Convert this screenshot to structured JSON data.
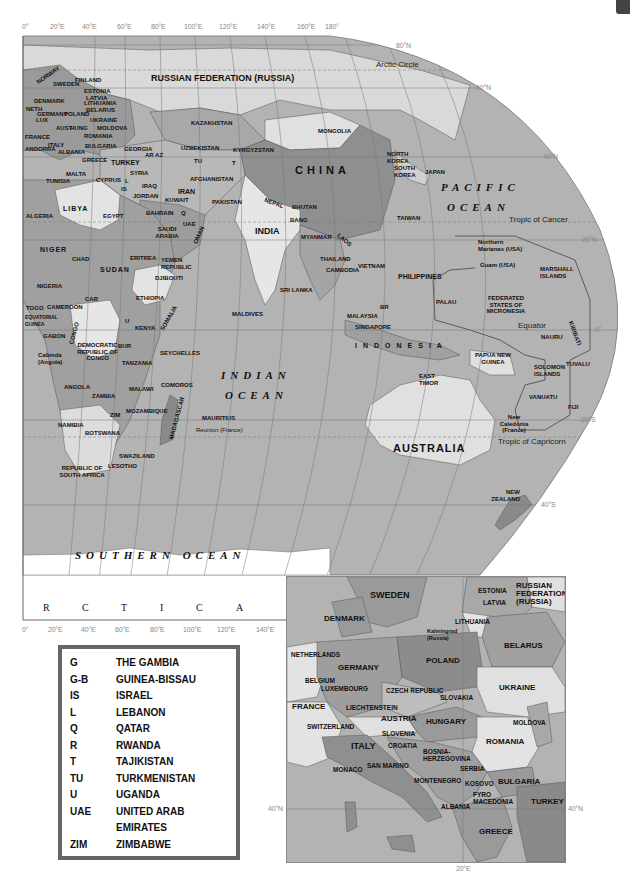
{
  "main_map": {
    "top_longitude_ticks": [
      "0°",
      "20°E",
      "40°E",
      "60°E",
      "80°E",
      "100°E",
      "120°E",
      "140°E",
      "160°E",
      "180°"
    ],
    "bottom_longitude_ticks": [
      "0°",
      "20°E",
      "40°E",
      "60°E",
      "80°E",
      "100°E",
      "120°E",
      "140°E"
    ],
    "latitude_ticks": [
      "80°N",
      "60°N",
      "40°N",
      "20°N",
      "0°",
      "20°S",
      "40°S"
    ],
    "reference_lines": {
      "arctic_circle": "Arctic Circle",
      "tropic_of_cancer": "Tropic of Cancer",
      "equator": "Equator",
      "tropic_of_capricorn": "Tropic of Capricorn"
    },
    "oceans": {
      "pacific_1": "PACIFIC",
      "pacific_2": "OCEAN",
      "indian_1": "INDIAN",
      "indian_2": "OCEAN",
      "southern": "SOUTHERN OCEAN"
    },
    "antarctica_letters": [
      "R",
      "C",
      "T",
      "I",
      "C",
      "A"
    ],
    "countries": {
      "russia": "RUSSIAN FEDERATION (RUSSIA)",
      "kazakhstan": "KAZAKHSTAN",
      "mongolia": "MONGOLIA",
      "china": "CHINA",
      "north_korea": "NORTH KOREA",
      "south_korea": "SOUTH KOREA",
      "japan": "JAPAN",
      "taiwan": "TAIWAN",
      "uzbekistan": "UZBEKISTAN",
      "kyrgyzstan": "KYRGYZSTAN",
      "tu": "TU",
      "t": "T",
      "afghanistan": "AFGHANISTAN",
      "pakistan": "PAKISTAN",
      "iran": "IRAN",
      "iraq": "IRAQ",
      "syria": "SYRIA",
      "turkey": "TURKEY",
      "georgia": "GEORGIA",
      "ar_az": "AR AZ",
      "cyprus": "CYPRUS",
      "l": "L",
      "is": "IS",
      "jordan": "JORDAN",
      "kuwait": "KUWAIT",
      "bahrain": "BAHRAIN",
      "q": "Q",
      "uae": "UAE",
      "saudi_arabia": "SAUDI ARABIA",
      "oman": "OMAN",
      "yemen": "YEMEN REPUBLIC",
      "india": "INDIA",
      "nepal": "NEPAL",
      "bhutan": "BHUTAN",
      "bang": "BANG",
      "myanmar": "MYANMAR",
      "laos": "LAOS",
      "thailand": "THAILAND",
      "cambodia": "CAMBODIA",
      "vietnam": "VIETNAM",
      "philippines": "PHILIPPINES",
      "sri_lanka": "SRI LANKA",
      "maldives": "MALDIVES",
      "malaysia": "MALAYSIA",
      "br": "BR",
      "singapore": "SINGAPORE",
      "indonesia": "INDONESIA",
      "east_timor": "EAST TIMOR",
      "papua_new_guinea": "PAPUA NEW GUINEA",
      "australia": "AUSTRALIA",
      "new_zealand": "NEW ZEALAND",
      "northern_marianas": "Northern Marianas (USA)",
      "guam": "Guam (USA)",
      "marshall_islands": "MARSHALL ISLANDS",
      "palau": "PALAU",
      "micronesia": "FEDERATED STATES OF MICRONESIA",
      "nauru": "NAURU",
      "kiribati": "KIRIBATI",
      "tuvalu": "TUVALU",
      "solomon_islands": "SOLOMON ISLANDS",
      "vanuatu": "VANUATU",
      "fiji": "FIJI",
      "new_caledonia": "New Caledonia (France)",
      "norway": "NORWAY",
      "sweden": "SWEDEN",
      "finland": "FINLAND",
      "estonia": "ESTONIA",
      "latvia": "LATVIA",
      "lithuania": "LITHUANIA",
      "belarus": "BELARUS",
      "denmark": "DENMARK",
      "neth": "NETH",
      "germany": "GERMANY",
      "poland": "POLAND",
      "lux": "LUX",
      "ukraine": "UKRAINE",
      "moldova": "MOLDOVA",
      "france": "FRANCE",
      "aust": "AUST",
      "hung": "HUNG",
      "romania": "ROMANIA",
      "italy": "ITALY",
      "bulgaria": "BULGARIA",
      "andorra": "ANDORRA",
      "albania": "ALBANIA",
      "greece": "GREECE",
      "malta": "MALTA",
      "tunisia": "TUNISIA",
      "algeria": "ALGERIA",
      "libya": "LIBYA",
      "egypt": "EGYPT",
      "niger": "NIGER",
      "chad": "CHAD",
      "sudan": "SUDAN",
      "eritrea": "ERITREA",
      "djibouti": "DJIBOUTI",
      "ethiopia": "ETHIOPIA",
      "somalia": "SOMALIA",
      "nigeria": "NIGERIA",
      "togo": "TOGO",
      "cameroon": "CAMEROON",
      "car": "CAR",
      "equatorial_guinea": "EQUATORIAL GUINEA",
      "gabon": "GABON",
      "congo": "CONGO",
      "drc": "DEMOCRATIC REPUBLIC OF CONGO",
      "cabinda": "Cabinda (Angola)",
      "u": "U",
      "kenya": "KENYA",
      "bur": "BUR",
      "tanzania": "TANZANIA",
      "seychelles": "SEYCHELLES",
      "angola": "ANGOLA",
      "zambia": "ZAMBIA",
      "malawi": "MALAWI",
      "comoros": "COMOROS",
      "zim": "ZIM",
      "mozambique": "MOZAMBIQUE",
      "madagascar": "MADAGASCAR",
      "mauritius": "MAURITIUS",
      "reunion": "Reunion (France)",
      "namibia": "NAMIBIA",
      "botswana": "BOTSWANA",
      "swaziland": "SWAZILAND",
      "lesotho": "LESOTHO",
      "south_africa": "REPUBLIC OF SOUTH AFRICA"
    }
  },
  "legend": {
    "entries": [
      {
        "code": "G",
        "name": "THE GAMBIA"
      },
      {
        "code": "G-B",
        "name": "GUINEA-BISSAU"
      },
      {
        "code": "IS",
        "name": "ISRAEL"
      },
      {
        "code": "L",
        "name": "LEBANON"
      },
      {
        "code": "Q",
        "name": "QATAR"
      },
      {
        "code": "R",
        "name": "RWANDA"
      },
      {
        "code": "T",
        "name": "TAJIKISTAN"
      },
      {
        "code": "TU",
        "name": "TURKMENISTAN"
      },
      {
        "code": "U",
        "name": "UGANDA"
      },
      {
        "code": "UAE",
        "name": "UNITED ARAB EMIRATES"
      },
      {
        "code": "ZIM",
        "name": "ZIMBABWE"
      }
    ]
  },
  "inset_map": {
    "latitude_tick_left": "40°N",
    "latitude_tick_right": "40°N",
    "longitude_tick": "20°E",
    "countries": {
      "sweden": "SWEDEN",
      "estonia": "ESTONIA",
      "russia": "RUSSIAN FEDERATION (RUSSIA)",
      "latvia": "LATVIA",
      "denmark": "DENMARK",
      "lithuania": "LITHUANIA",
      "kaliningrad": "Kaliningrad (Russia)",
      "belarus": "BELARUS",
      "netherlands": "NETHERLANDS",
      "germany": "GERMANY",
      "poland": "POLAND",
      "belgium": "BELGIUM",
      "luxembourg": "LUXEMBOURG",
      "czech": "CZECH REPUBLIC",
      "ukraine": "UKRAINE",
      "slovakia": "SLOVAKIA",
      "france": "FRANCE",
      "liechtenstein": "LIECHTENSTEIN",
      "austria": "AUSTRIA",
      "hungary": "HUNGARY",
      "moldova": "MOLDOVA",
      "switzerland": "SWITZERLAND",
      "slovenia": "SLOVENIA",
      "croatia": "CROATIA",
      "romania": "ROMANIA",
      "italy": "ITALY",
      "bosnia": "BOSNIA-HERZEGOVINA",
      "serbia": "SERBIA",
      "monaco": "MONACO",
      "san_marino": "SAN MARINO",
      "montenegro": "MONTENEGRO",
      "kosovo": "KOSOVO",
      "bulgaria": "BULGARIA",
      "macedonia": "FYRO MACEDONIA",
      "albania": "ALBANIA",
      "turkey": "TURKEY",
      "greece": "GREECE"
    }
  }
}
